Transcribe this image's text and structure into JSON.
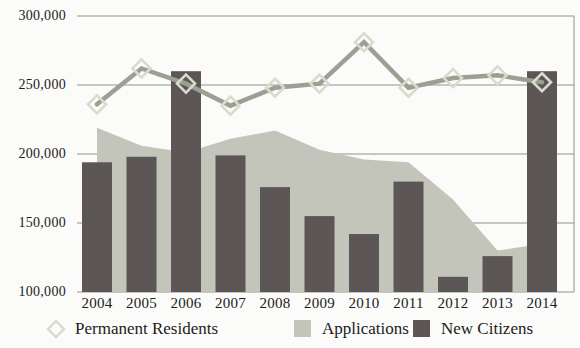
{
  "chart_data": {
    "type": "combo",
    "title": "",
    "xlabel": "",
    "ylabel": "",
    "categories": [
      "2004",
      "2005",
      "2006",
      "2007",
      "2008",
      "2009",
      "2010",
      "2011",
      "2012",
      "2013",
      "2014"
    ],
    "series": [
      {
        "name": "Permanent Residents",
        "type": "line",
        "marker": "open-diamond",
        "color": "#9ba094",
        "marker_stroke": "#d9dbcb",
        "values": [
          236000,
          262000,
          251000,
          235000,
          248000,
          251000,
          281000,
          248000,
          255000,
          257000,
          252000
        ]
      },
      {
        "name": "Applications",
        "type": "area",
        "color": "#c3c5ba",
        "values": [
          219000,
          206000,
          201000,
          211000,
          217000,
          203000,
          196000,
          194000,
          167000,
          130000,
          135000
        ]
      },
      {
        "name": "New Citizens",
        "type": "bar",
        "color": "#5d5656",
        "values": [
          194000,
          198000,
          260000,
          199000,
          176000,
          155000,
          142000,
          180000,
          111000,
          126000,
          260000
        ]
      }
    ],
    "ylim": [
      100000,
      300000
    ],
    "ytick_step": 50000,
    "yticks": [
      {
        "value": 100000,
        "label": "100,000"
      },
      {
        "value": 150000,
        "label": "150,000"
      },
      {
        "value": 200000,
        "label": "200,000"
      },
      {
        "value": 250000,
        "label": "250,000"
      },
      {
        "value": 300000,
        "label": "300,000"
      }
    ],
    "grid": true,
    "gridline_color": "#90938e",
    "frame_color": "#90938e",
    "background": "#fbfbf9",
    "axis_text_color": "#1c1c1c",
    "legend_position": "bottom"
  }
}
